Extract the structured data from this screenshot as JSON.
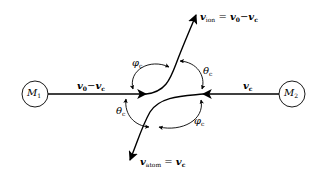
{
  "diagram": {
    "nodes": [
      {
        "id": "M1",
        "label_main": "M",
        "label_sub": "1"
      },
      {
        "id": "M2",
        "label_main": "M",
        "label_sub": "2"
      }
    ],
    "edges": {
      "left_velocity": {
        "a": "v",
        "a_sub": "0",
        "op": "−",
        "b": "v",
        "b_sub": "c"
      },
      "right_velocity": {
        "a": "v",
        "a_sub": "c"
      },
      "ion": {
        "lhs": "v",
        "lhs_sub": "ion",
        "eq": " = ",
        "a": "v",
        "a_sub": "0",
        "op": "−",
        "b": "v",
        "b_sub": "c"
      },
      "atom": {
        "lhs": "v",
        "lhs_sub": "atom",
        "eq": " = ",
        "a": "v",
        "a_sub": "c"
      }
    },
    "angles": {
      "phi_upper": {
        "sym": "φ",
        "sub": "c"
      },
      "theta_upper": {
        "sym": "θ",
        "sub": "c"
      },
      "theta_lower": {
        "sym": "θ",
        "sub": "c"
      },
      "phi_lower": {
        "sym": "φ",
        "sub": "c"
      }
    },
    "colors": {
      "stroke": "#000000",
      "background": "#ffffff"
    }
  }
}
